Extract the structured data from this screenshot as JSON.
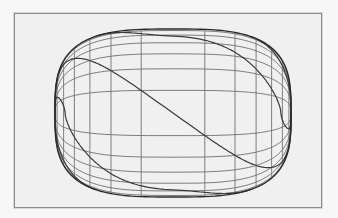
{
  "figure": {
    "colors": {
      "background": "#f7f7f7",
      "frame_fill": "#f0f0f0",
      "frame_border": "#8a8a8a",
      "grid": "#6e6e6e",
      "helix": "#3a3a3a",
      "outline": "#2a2a2a"
    },
    "shape": {
      "center": [
        173,
        113
      ],
      "rx": 118,
      "ry": 84,
      "squareness": 0.62
    },
    "meridian_count": 13,
    "parallel_count": 13,
    "helix_count": 7,
    "helix_turns": 0.5
  }
}
